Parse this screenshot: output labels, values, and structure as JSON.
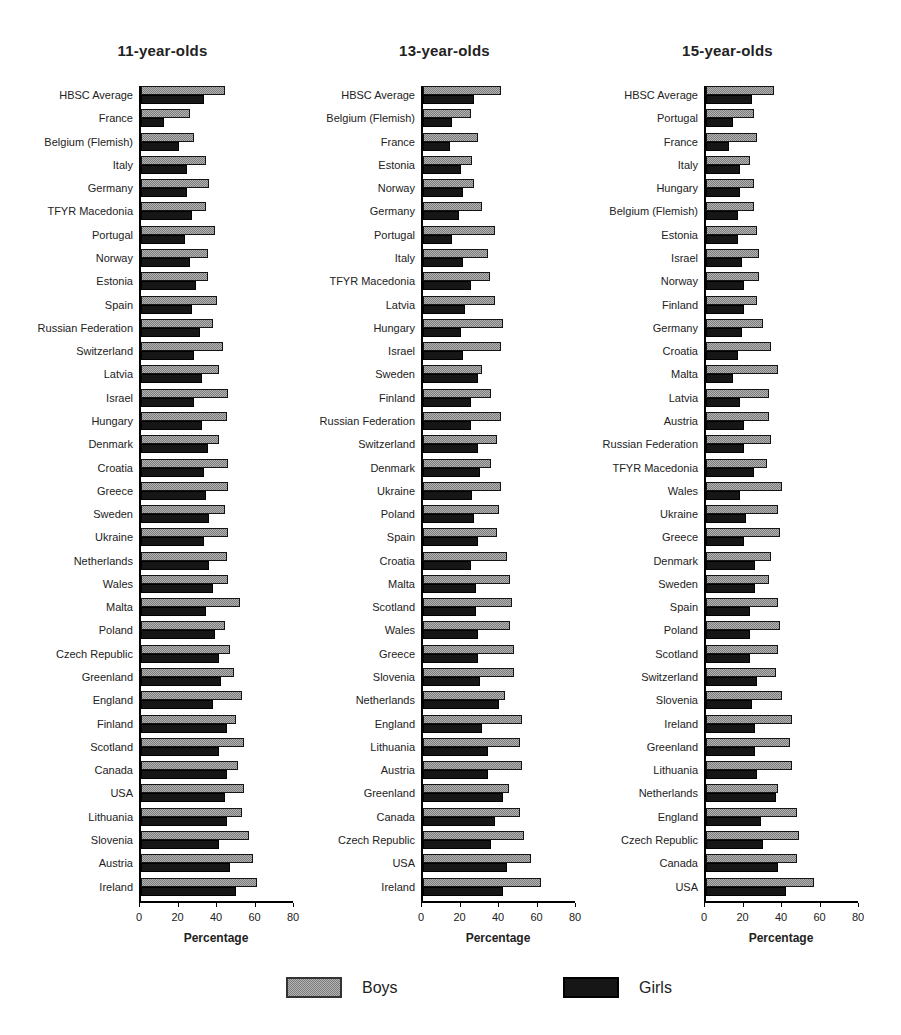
{
  "chart_data": {
    "type": "bar",
    "orientation": "horizontal",
    "xlabel": "Percentage",
    "xlim": [
      0,
      80
    ],
    "xticks": [
      0,
      20,
      40,
      60,
      80
    ],
    "series_names": [
      "Boys",
      "Girls"
    ],
    "colors": {
      "boys": "#b3b3b3",
      "girls": "#161616",
      "axis": "#000000"
    },
    "legend_position": "bottom",
    "grid": false,
    "panels": [
      {
        "title": "11-year-olds",
        "rows": [
          {
            "label": "HBSC Average",
            "boys": 44,
            "girls": 33
          },
          {
            "label": "France",
            "boys": 26,
            "girls": 12
          },
          {
            "label": "Belgium (Flemish)",
            "boys": 28,
            "girls": 20
          },
          {
            "label": "Italy",
            "boys": 34,
            "girls": 24
          },
          {
            "label": "Germany",
            "boys": 36,
            "girls": 24
          },
          {
            "label": "TFYR Macedonia",
            "boys": 34,
            "girls": 27
          },
          {
            "label": "Portugal",
            "boys": 39,
            "girls": 23
          },
          {
            "label": "Norway",
            "boys": 35,
            "girls": 26
          },
          {
            "label": "Estonia",
            "boys": 35,
            "girls": 29
          },
          {
            "label": "Spain",
            "boys": 40,
            "girls": 27
          },
          {
            "label": "Russian Federation",
            "boys": 38,
            "girls": 31
          },
          {
            "label": "Switzerland",
            "boys": 43,
            "girls": 28
          },
          {
            "label": "Latvia",
            "boys": 41,
            "girls": 32
          },
          {
            "label": "Israel",
            "boys": 46,
            "girls": 28
          },
          {
            "label": "Hungary",
            "boys": 45,
            "girls": 32
          },
          {
            "label": "Denmark",
            "boys": 41,
            "girls": 35
          },
          {
            "label": "Croatia",
            "boys": 46,
            "girls": 33
          },
          {
            "label": "Greece",
            "boys": 46,
            "girls": 34
          },
          {
            "label": "Sweden",
            "boys": 44,
            "girls": 36
          },
          {
            "label": "Ukraine",
            "boys": 46,
            "girls": 33
          },
          {
            "label": "Netherlands",
            "boys": 45,
            "girls": 36
          },
          {
            "label": "Wales",
            "boys": 46,
            "girls": 38
          },
          {
            "label": "Malta",
            "boys": 52,
            "girls": 34
          },
          {
            "label": "Poland",
            "boys": 44,
            "girls": 39
          },
          {
            "label": "Czech Republic",
            "boys": 47,
            "girls": 41
          },
          {
            "label": "Greenland",
            "boys": 49,
            "girls": 42
          },
          {
            "label": "England",
            "boys": 53,
            "girls": 38
          },
          {
            "label": "Finland",
            "boys": 50,
            "girls": 45
          },
          {
            "label": "Scotland",
            "boys": 54,
            "girls": 41
          },
          {
            "label": "Canada",
            "boys": 51,
            "girls": 45
          },
          {
            "label": "USA",
            "boys": 54,
            "girls": 44
          },
          {
            "label": "Lithuania",
            "boys": 53,
            "girls": 45
          },
          {
            "label": "Slovenia",
            "boys": 57,
            "girls": 41
          },
          {
            "label": "Austria",
            "boys": 59,
            "girls": 47
          },
          {
            "label": "Ireland",
            "boys": 61,
            "girls": 50
          }
        ]
      },
      {
        "title": "13-year-olds",
        "rows": [
          {
            "label": "HBSC Average",
            "boys": 41,
            "girls": 27
          },
          {
            "label": "Belgium (Flemish)",
            "boys": 25,
            "girls": 15
          },
          {
            "label": "France",
            "boys": 29,
            "girls": 14
          },
          {
            "label": "Estonia",
            "boys": 26,
            "girls": 20
          },
          {
            "label": "Norway",
            "boys": 27,
            "girls": 21
          },
          {
            "label": "Germany",
            "boys": 31,
            "girls": 19
          },
          {
            "label": "Portugal",
            "boys": 38,
            "girls": 15
          },
          {
            "label": "Italy",
            "boys": 34,
            "girls": 21
          },
          {
            "label": "TFYR Macedonia",
            "boys": 35,
            "girls": 25
          },
          {
            "label": "Latvia",
            "boys": 38,
            "girls": 22
          },
          {
            "label": "Hungary",
            "boys": 42,
            "girls": 20
          },
          {
            "label": "Israel",
            "boys": 41,
            "girls": 21
          },
          {
            "label": "Sweden",
            "boys": 31,
            "girls": 29
          },
          {
            "label": "Finland",
            "boys": 36,
            "girls": 25
          },
          {
            "label": "Russian Federation",
            "boys": 41,
            "girls": 25
          },
          {
            "label": "Switzerland",
            "boys": 39,
            "girls": 29
          },
          {
            "label": "Denmark",
            "boys": 36,
            "girls": 30
          },
          {
            "label": "Ukraine",
            "boys": 41,
            "girls": 26
          },
          {
            "label": "Poland",
            "boys": 40,
            "girls": 27
          },
          {
            "label": "Spain",
            "boys": 39,
            "girls": 29
          },
          {
            "label": "Croatia",
            "boys": 44,
            "girls": 25
          },
          {
            "label": "Malta",
            "boys": 46,
            "girls": 28
          },
          {
            "label": "Scotland",
            "boys": 47,
            "girls": 28
          },
          {
            "label": "Wales",
            "boys": 46,
            "girls": 29
          },
          {
            "label": "Greece",
            "boys": 48,
            "girls": 29
          },
          {
            "label": "Slovenia",
            "boys": 48,
            "girls": 30
          },
          {
            "label": "Netherlands",
            "boys": 43,
            "girls": 40
          },
          {
            "label": "England",
            "boys": 52,
            "girls": 31
          },
          {
            "label": "Lithuania",
            "boys": 51,
            "girls": 34
          },
          {
            "label": "Austria",
            "boys": 52,
            "girls": 34
          },
          {
            "label": "Greenland",
            "boys": 45,
            "girls": 42
          },
          {
            "label": "Canada",
            "boys": 51,
            "girls": 38
          },
          {
            "label": "Czech Republic",
            "boys": 53,
            "girls": 36
          },
          {
            "label": "USA",
            "boys": 57,
            "girls": 44
          },
          {
            "label": "Ireland",
            "boys": 62,
            "girls": 42
          }
        ]
      },
      {
        "title": "15-year-olds",
        "rows": [
          {
            "label": "HBSC Average",
            "boys": 36,
            "girls": 24
          },
          {
            "label": "Portugal",
            "boys": 25,
            "girls": 14
          },
          {
            "label": "France",
            "boys": 27,
            "girls": 12
          },
          {
            "label": "Italy",
            "boys": 23,
            "girls": 18
          },
          {
            "label": "Hungary",
            "boys": 25,
            "girls": 18
          },
          {
            "label": "Belgium (Flemish)",
            "boys": 25,
            "girls": 17
          },
          {
            "label": "Estonia",
            "boys": 27,
            "girls": 17
          },
          {
            "label": "Israel",
            "boys": 28,
            "girls": 19
          },
          {
            "label": "Norway",
            "boys": 28,
            "girls": 20
          },
          {
            "label": "Finland",
            "boys": 27,
            "girls": 20
          },
          {
            "label": "Germany",
            "boys": 30,
            "girls": 19
          },
          {
            "label": "Croatia",
            "boys": 34,
            "girls": 17
          },
          {
            "label": "Malta",
            "boys": 38,
            "girls": 14
          },
          {
            "label": "Latvia",
            "boys": 33,
            "girls": 18
          },
          {
            "label": "Austria",
            "boys": 33,
            "girls": 20
          },
          {
            "label": "Russian Federation",
            "boys": 34,
            "girls": 20
          },
          {
            "label": "TFYR Macedonia",
            "boys": 32,
            "girls": 25
          },
          {
            "label": "Wales",
            "boys": 40,
            "girls": 18
          },
          {
            "label": "Ukraine",
            "boys": 38,
            "girls": 21
          },
          {
            "label": "Greece",
            "boys": 39,
            "girls": 20
          },
          {
            "label": "Denmark",
            "boys": 34,
            "girls": 26
          },
          {
            "label": "Sweden",
            "boys": 33,
            "girls": 26
          },
          {
            "label": "Spain",
            "boys": 38,
            "girls": 23
          },
          {
            "label": "Poland",
            "boys": 39,
            "girls": 23
          },
          {
            "label": "Scotland",
            "boys": 38,
            "girls": 23
          },
          {
            "label": "Switzerland",
            "boys": 37,
            "girls": 27
          },
          {
            "label": "Slovenia",
            "boys": 40,
            "girls": 24
          },
          {
            "label": "Ireland",
            "boys": 45,
            "girls": 26
          },
          {
            "label": "Greenland",
            "boys": 44,
            "girls": 26
          },
          {
            "label": "Lithuania",
            "boys": 45,
            "girls": 27
          },
          {
            "label": "Netherlands",
            "boys": 38,
            "girls": 37
          },
          {
            "label": "England",
            "boys": 48,
            "girls": 29
          },
          {
            "label": "Czech Republic",
            "boys": 49,
            "girls": 30
          },
          {
            "label": "Canada",
            "boys": 48,
            "girls": 38
          },
          {
            "label": "USA",
            "boys": 57,
            "girls": 42
          }
        ]
      }
    ]
  }
}
